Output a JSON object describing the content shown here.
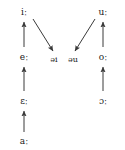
{
  "diagram": {
    "type": "vowel-shift-diagram",
    "background_color": "#ffffff",
    "stroke_color": "#3a3a3a",
    "text_color": "#1a1a1a",
    "left_column": {
      "name": "front-vowel-chain",
      "vowels": [
        {
          "id": "left-v1",
          "symbol": "iː",
          "x": 24,
          "y": 12
        },
        {
          "id": "left-v2",
          "symbol": "eː",
          "x": 24,
          "y": 57
        },
        {
          "id": "left-v3",
          "symbol": "ɛː",
          "x": 24,
          "y": 101
        },
        {
          "id": "left-v4",
          "symbol": "aː",
          "x": 24,
          "y": 141
        }
      ]
    },
    "right_column": {
      "name": "back-vowel-chain",
      "vowels": [
        {
          "id": "right-v1",
          "symbol": "uː",
          "x": 103,
          "y": 12
        },
        {
          "id": "right-v2",
          "symbol": "oː",
          "x": 103,
          "y": 57
        },
        {
          "id": "right-v3",
          "symbol": "ɔː",
          "x": 103,
          "y": 101
        }
      ]
    },
    "diphthongs": [
      {
        "id": "diph-1",
        "symbol": "əi",
        "x": 54,
        "y": 60
      },
      {
        "id": "diph-2",
        "symbol": "əu",
        "x": 73,
        "y": 60
      }
    ],
    "arrows": [
      {
        "id": "arrow-e-to-i",
        "name": "arrow-e-to-i",
        "x1": 24,
        "y1": 47,
        "x2": 24,
        "y2": 21
      },
      {
        "id": "arrow-eps-to-e",
        "name": "arrow-epsilon-to-e",
        "x1": 24,
        "y1": 91,
        "x2": 24,
        "y2": 66
      },
      {
        "id": "arrow-a-to-eps",
        "name": "arrow-a-to-epsilon",
        "x1": 24,
        "y1": 132,
        "x2": 24,
        "y2": 110
      },
      {
        "id": "arrow-o-to-u",
        "name": "arrow-o-to-u",
        "x1": 103,
        "y1": 47,
        "x2": 103,
        "y2": 21
      },
      {
        "id": "arrow-open-o-to-o",
        "name": "arrow-open-o-to-o",
        "x1": 103,
        "y1": 91,
        "x2": 103,
        "y2": 66
      },
      {
        "id": "arrow-i-to-ai",
        "name": "arrow-i-to-diphthong-ai",
        "x1": 33,
        "y1": 19,
        "x2": 53,
        "y2": 52
      },
      {
        "id": "arrow-u-to-au",
        "name": "arrow-u-to-diphthong-au",
        "x1": 95,
        "y1": 19,
        "x2": 75,
        "y2": 52
      }
    ]
  }
}
